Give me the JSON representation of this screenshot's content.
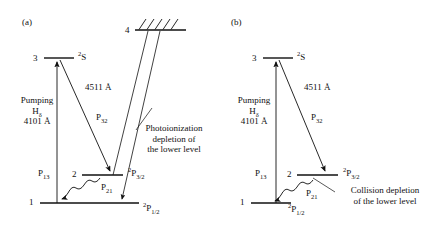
{
  "figure": {
    "background": "#ffffff",
    "stroke_color": "#111111",
    "width": 425,
    "height": 228
  },
  "panels": [
    {
      "tag": "(a)",
      "levels": [
        {
          "name": "level-4",
          "number": "4",
          "term": "",
          "note": "ionization continuum with hatching"
        },
        {
          "number": "3",
          "term_sup": "2",
          "term": "S"
        },
        {
          "number": "2",
          "term_sup": "2",
          "term": "P",
          "term_sub": "3/2"
        },
        {
          "number": "1",
          "term_sup": "2",
          "term": "P",
          "term_sub": "1/2"
        }
      ],
      "labels": {
        "level4_number": "4",
        "level3_number": "3",
        "level2_number": "2",
        "level1_number": "1",
        "term_2S_sup": "2",
        "term_2S": "S",
        "term_P32_sup": "2",
        "term_P32": "P",
        "term_P32_sub": "3/2",
        "term_P12_sup": "2",
        "term_P12": "P",
        "term_P12_sub": "1/2",
        "pumping_line1": "Pumping",
        "pumping_line2_base": "H",
        "pumping_line2_sub": "δ",
        "pumping_line3": "4101 Å",
        "transition_4511": "4511 Å",
        "rate_P13_base": "P",
        "rate_P13_sub": "13",
        "rate_P32_base": "P",
        "rate_P32_sub": "32",
        "rate_P21_base": "P",
        "rate_P21_sub": "21",
        "note_line1": "Photoionization",
        "note_line2": "depletion of",
        "note_line3": "the lower level"
      }
    },
    {
      "tag": "(b)",
      "levels": [
        {
          "number": "3",
          "term_sup": "2",
          "term": "S"
        },
        {
          "number": "2",
          "term_sup": "2",
          "term": "P",
          "term_sub": "3/2"
        },
        {
          "number": "1",
          "term_sup": "2",
          "term": "P",
          "term_sub": "1/2"
        }
      ],
      "labels": {
        "level3_number": "3",
        "level2_number": "2",
        "level1_number": "1",
        "term_2S_sup": "2",
        "term_2S": "S",
        "term_P32_sup": "2",
        "term_P32": "P",
        "term_P32_sub": "3/2",
        "term_P12_sup": "2",
        "term_P12": "P",
        "term_P12_sub": "1/2",
        "pumping_line1": "Pumping",
        "pumping_line2_base": "H",
        "pumping_line2_sub": "δ",
        "pumping_line3": "4101 Å",
        "transition_4511": "4511 Å",
        "rate_P13_base": "P",
        "rate_P13_sub": "13",
        "rate_P32_base": "P",
        "rate_P32_sub": "32",
        "rate_P21_base": "P",
        "rate_P21_sub": "21",
        "note_line1": "Collision depletion",
        "note_line2": "of the lower level"
      }
    }
  ]
}
